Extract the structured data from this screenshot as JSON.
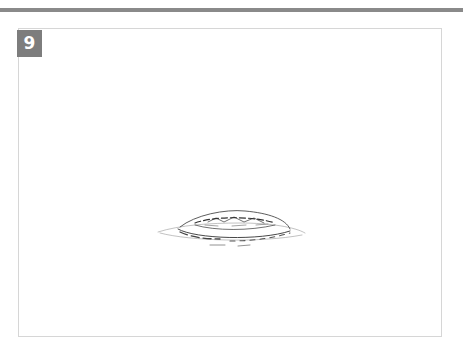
{
  "figure": {
    "step_number": "9",
    "illustration": "sketch-of-flat-round-loaf-icon",
    "colors": {
      "top_rule": "#8a8a8a",
      "badge_bg": "#7d7d7d",
      "badge_text": "#ffffff",
      "frame_border": "#d6d6d6",
      "sketch_stroke": "#333333"
    }
  }
}
